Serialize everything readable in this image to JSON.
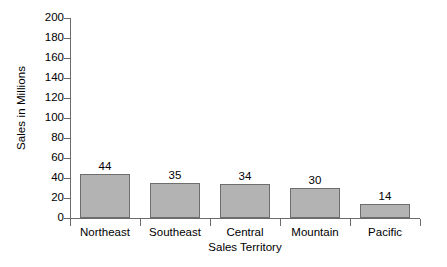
{
  "chart_data": {
    "type": "bar",
    "title": "",
    "categories": [
      "Northeast",
      "Southeast",
      "Central",
      "Mountain",
      "Pacific"
    ],
    "values": [
      44,
      35,
      34,
      30,
      14
    ],
    "value_labels": [
      "44",
      "35",
      "34",
      "30",
      "14"
    ],
    "xlabel": "Sales Territory",
    "ylabel": "Sales in Millions",
    "ylim": [
      0,
      200
    ],
    "y_ticks": [
      0,
      20,
      40,
      60,
      80,
      100,
      120,
      140,
      160,
      180,
      200
    ],
    "y_tick_labels": [
      "0",
      "20",
      "40",
      "60",
      "80",
      "100",
      "120",
      "140",
      "160",
      "180",
      "200"
    ],
    "grid": false,
    "legend": false,
    "bar_color": "#b3b3b3",
    "bar_border_color": "#6e6e6e",
    "axis_color": "#6b6b6b",
    "text_color": "#000000",
    "background_color": "#ffffff"
  },
  "axes": {
    "y_title": "Sales in Millions",
    "x_title": "Sales Territory"
  },
  "bars": [
    {
      "category": "Northeast",
      "value": 44,
      "label": "44"
    },
    {
      "category": "Southeast",
      "value": 35,
      "label": "35"
    },
    {
      "category": "Central",
      "value": 34,
      "label": "34"
    },
    {
      "category": "Mountain",
      "value": 30,
      "label": "30"
    },
    {
      "category": "Pacific",
      "value": 14,
      "label": "14"
    }
  ]
}
